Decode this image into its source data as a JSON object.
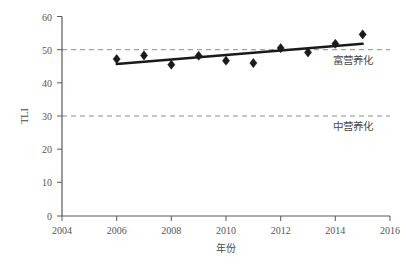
{
  "chart_data": {
    "type": "scatter",
    "title": "",
    "subtitle": "",
    "xlabel": "年份",
    "ylabel": "TLI",
    "xlim": [
      2004,
      2016
    ],
    "ylim": [
      0,
      60
    ],
    "xticks": [
      "2004",
      "2006",
      "2008",
      "2010",
      "2012",
      "2014",
      "2016"
    ],
    "xtick_values": [
      2004,
      2006,
      2008,
      2010,
      2012,
      2014,
      2016
    ],
    "yticks": [
      "0",
      "10",
      "20",
      "30",
      "40",
      "50",
      "60"
    ],
    "ytick_values": [
      0,
      10,
      20,
      30,
      40,
      50,
      60
    ],
    "grid": false,
    "legend": "none",
    "x": [
      2006,
      2007,
      2008,
      2009,
      2010,
      2011,
      2012,
      2013,
      2014,
      2015
    ],
    "values": [
      47.2,
      48.3,
      45.5,
      48.2,
      46.7,
      46.0,
      50.5,
      49.2,
      51.8,
      54.6
    ],
    "series": [
      {
        "name": "TLI",
        "marker": "diamond",
        "color": "#1a1a1a",
        "x": [
          2006,
          2007,
          2008,
          2009,
          2010,
          2011,
          2012,
          2013,
          2014,
          2015
        ],
        "values": [
          47.2,
          48.3,
          45.5,
          48.2,
          46.7,
          46.0,
          50.5,
          49.2,
          51.8,
          54.6
        ]
      },
      {
        "name": "趋势线",
        "type": "trend",
        "color": "#1a1a1a",
        "x": [
          2006,
          2015
        ],
        "values": [
          45.7,
          51.8
        ]
      }
    ],
    "reference_lines": [
      {
        "name": "eutrophic-threshold",
        "value": 50,
        "label": "富营养化",
        "style": "dashed",
        "color": "#8c8c8c"
      },
      {
        "name": "mesotrophic-threshold",
        "value": 30,
        "label": "中营养化",
        "style": "dashed",
        "color": "#8c8c8c"
      }
    ],
    "annotations": [
      {
        "name": "eutrophic-label",
        "text": "富营养化",
        "x": 2014.3,
        "y": 46.5
      },
      {
        "name": "mesotrophic-label",
        "text": "中营养化",
        "x": 2014.3,
        "y": 26.5
      }
    ]
  },
  "axes": {
    "y_title": "TLI",
    "x_title": "年份",
    "ytick_0": "0",
    "ytick_10": "10",
    "ytick_20": "20",
    "ytick_30": "30",
    "ytick_40": "40",
    "ytick_50": "50",
    "ytick_60": "60",
    "xtick_2004": "2004",
    "xtick_2006": "2006",
    "xtick_2008": "2008",
    "xtick_2010": "2010",
    "xtick_2012": "2012",
    "xtick_2014": "2014",
    "xtick_2016": "2016"
  },
  "annotations": {
    "eutrophic": "富营养化",
    "mesotrophic": "中营养化"
  },
  "colors": {
    "marker": "#1a1a1a",
    "trend": "#1a1a1a",
    "threshold": "#8c8c8c",
    "axis": "#595959",
    "text": "#4a4a4a",
    "background": "#ffffff"
  }
}
